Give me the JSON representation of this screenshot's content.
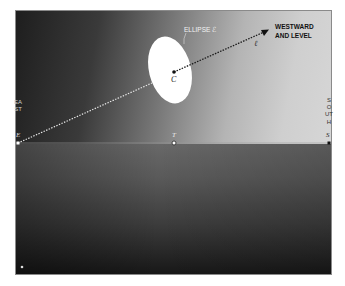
{
  "diagram": {
    "colors": {
      "sky_dark": "#1e1e1e",
      "sky_light": "#d6d6d6",
      "ground_top": "#686868",
      "ground_bottom": "#161616",
      "ellipse_fill": "#ffffff",
      "line_color": "#1a1a1a"
    },
    "labels": {
      "ellipse": "ELLIPSE ℰ",
      "center": "C",
      "direction_line": "ℓ",
      "direction_text_line1": "WESTWARD",
      "direction_text_line2": "AND LEVEL",
      "east_vertical": "EAST",
      "east_point": "E",
      "south_vertical": "SOUTH",
      "south_point": "S",
      "t_point": "T"
    },
    "points": {
      "E": {
        "x": 18,
        "y": 143
      },
      "T": {
        "x": 174,
        "y": 143
      },
      "S": {
        "x": 329,
        "y": 143
      },
      "C": {
        "x": 174,
        "y": 72
      },
      "arrow_tip": {
        "x": 268,
        "y": 30
      },
      "bottom_star": {
        "x": 22,
        "y": 267
      }
    },
    "ellipse": {
      "cx": 170,
      "cy": 70,
      "rx": 21,
      "ry": 34,
      "rotate_deg": -12
    }
  }
}
